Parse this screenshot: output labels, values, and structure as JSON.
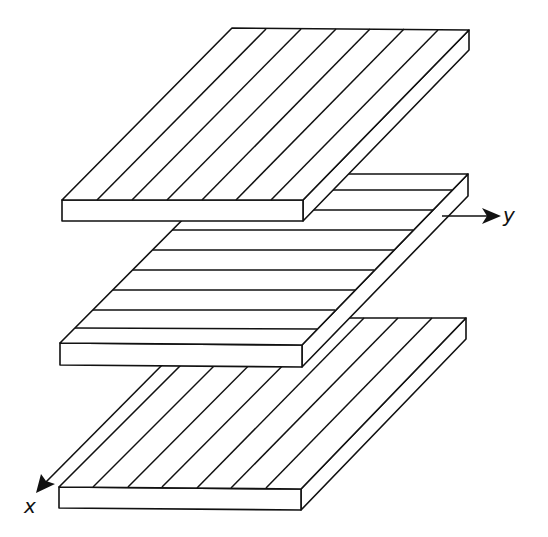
{
  "diagram": {
    "type": "laminate-plies-exploded-view",
    "line_color": "#111111",
    "background": "#ffffff",
    "axes": {
      "x": {
        "label": "x",
        "direction": "down-left (fiber direction of outer plies)"
      },
      "y": {
        "label": "y",
        "direction": "right"
      }
    },
    "plies": [
      {
        "position": "top",
        "fiber_orientation": "x (diagonal stripes)",
        "stripe_count": 7
      },
      {
        "position": "middle",
        "fiber_orientation": "y (horizontal stripes)",
        "stripe_count": 8
      },
      {
        "position": "bottom",
        "fiber_orientation": "x (diagonal stripes)",
        "stripe_count": 7
      }
    ]
  }
}
